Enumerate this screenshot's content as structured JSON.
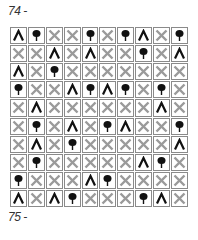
{
  "puzzle": {
    "label_top": "74 -",
    "label_bottom": "75 -",
    "legend": {
      "T": "tree-icon",
      "A": "tent-icon",
      "X": "cross-icon"
    },
    "colors": {
      "tree": "#111111",
      "tent": "#111111",
      "cross": "#9a9a9a",
      "border": "#8a8a8a"
    },
    "rows": [
      [
        "A",
        "T",
        "X",
        "X",
        "T",
        "X",
        "T",
        "A",
        "X",
        "T"
      ],
      [
        "X",
        "X",
        "A",
        "X",
        "A",
        "X",
        "X",
        "T",
        "X",
        "A"
      ],
      [
        "A",
        "X",
        "T",
        "X",
        "X",
        "X",
        "X",
        "X",
        "X",
        "X"
      ],
      [
        "T",
        "X",
        "X",
        "A",
        "T",
        "A",
        "T",
        "X",
        "T",
        "X"
      ],
      [
        "X",
        "A",
        "X",
        "X",
        "X",
        "X",
        "X",
        "X",
        "A",
        "X"
      ],
      [
        "X",
        "T",
        "X",
        "A",
        "X",
        "T",
        "A",
        "X",
        "X",
        "T"
      ],
      [
        "X",
        "A",
        "X",
        "T",
        "X",
        "X",
        "X",
        "X",
        "X",
        "A"
      ],
      [
        "X",
        "T",
        "X",
        "X",
        "X",
        "X",
        "X",
        "A",
        "T",
        "X"
      ],
      [
        "T",
        "X",
        "X",
        "X",
        "A",
        "T",
        "X",
        "X",
        "X",
        "X"
      ],
      [
        "A",
        "X",
        "A",
        "T",
        "X",
        "X",
        "X",
        "T",
        "A",
        "X"
      ]
    ]
  }
}
